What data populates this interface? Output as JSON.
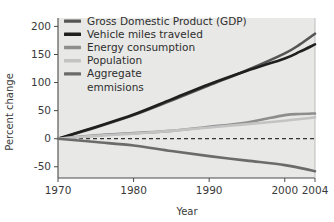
{
  "chart_data": {
    "type": "line",
    "title": "",
    "xlabel": "Year",
    "ylabel": "Percent change",
    "xlim": [
      1970,
      2004
    ],
    "ylim": [
      -70,
      215
    ],
    "xticks": [
      1970,
      1980,
      1990,
      2000,
      2004
    ],
    "xticklabels": [
      "1970",
      "1980",
      "1990",
      "2000",
      "2004"
    ],
    "yticks": [
      -50,
      0,
      50,
      100,
      150,
      200
    ],
    "yticklabels": [
      "-50",
      "0",
      "50",
      "100",
      "150",
      "200"
    ],
    "grid": false,
    "legend_position": "top-left",
    "zero_reference_line": {
      "value": 0,
      "style": "dashed",
      "color": "#333333"
    },
    "plot_background": "#e8e8e6",
    "x": [
      1970,
      1975,
      1980,
      1985,
      1990,
      1995,
      2000,
      2002,
      2004
    ],
    "series": [
      {
        "name": "Gross Domestic Product (GDP)",
        "color": "#555555",
        "values": [
          0,
          20,
          42,
          68,
          95,
          122,
          152,
          168,
          187
        ]
      },
      {
        "name": "Vehicle miles traveled",
        "color": "#1f1f1f",
        "values": [
          0,
          21,
          43,
          70,
          97,
          121,
          143,
          155,
          168
        ]
      },
      {
        "name": "Energy consumption",
        "color": "#8d8d8d",
        "values": [
          0,
          6,
          10,
          14,
          21,
          29,
          42,
          44,
          45
        ]
      },
      {
        "name": "Population",
        "color": "#c3c3c3",
        "values": [
          0,
          5,
          9,
          14,
          20,
          26,
          32,
          35,
          38
        ]
      },
      {
        "name": "Aggregate emmisions",
        "color": "#6b6b6b",
        "values": [
          0,
          -6,
          -12,
          -22,
          -31,
          -39,
          -47,
          -52,
          -58
        ]
      }
    ]
  },
  "legend": {
    "items": [
      {
        "label": "Gross Domestic Product (GDP)",
        "color": "#555555"
      },
      {
        "label": "Vehicle miles traveled",
        "color": "#1f1f1f"
      },
      {
        "label": "Energy consumption",
        "color": "#8d8d8d"
      },
      {
        "label": "Population",
        "color": "#c3c3c3"
      },
      {
        "label": "Aggregate",
        "color": "#6b6b6b"
      },
      {
        "label": "emmisions",
        "color": null
      }
    ]
  }
}
